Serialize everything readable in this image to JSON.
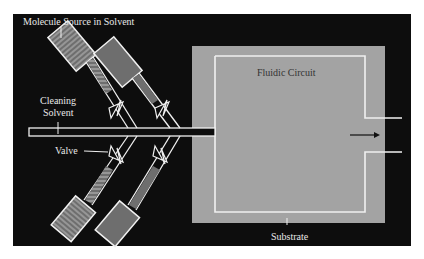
{
  "diagram": {
    "labels": {
      "molecule_source": "Molecule Source in Solvent",
      "cleaning_solvent_line1": "Cleaning",
      "cleaning_solvent_line2": "Solvent",
      "valve": "Valve",
      "fluidic_circuit": "Fluidic Circuit",
      "substrate": "Substrate"
    },
    "colors": {
      "background": "#0d0d0d",
      "substrate": "#a3a3a3",
      "channel": "#f0f0f0",
      "reservoir_fill": "#6e6e6e",
      "reservoir_hatch": "#8a8a8a"
    }
  }
}
